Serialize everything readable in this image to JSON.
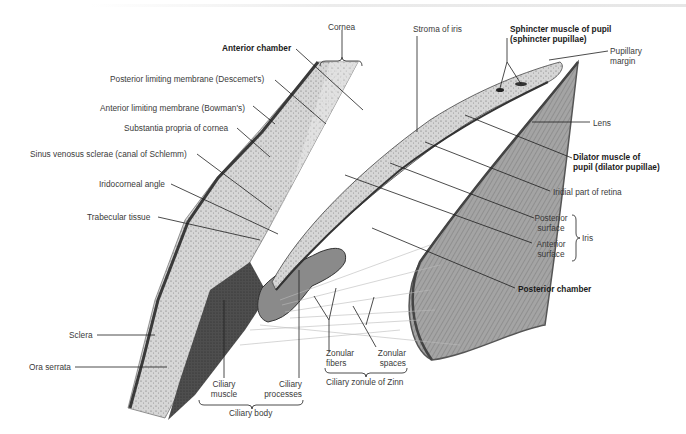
{
  "figure": {
    "type": "anatomical illustration"
  },
  "labels": {
    "cornea": "Cornea",
    "anterior_chamber": "Anterior chamber",
    "descemet": "Posterior limiting membrane (Descemet's)",
    "bowman": "Anterior limiting membrane (Bowman's)",
    "substantia": "Substantia propria of cornea",
    "schlemm": "Sinus venosus sclerae (canal of Schlemm)",
    "iridocorneal": "Iridocorneal angle",
    "trabecular": "Trabecular tissue",
    "sclera": "Sclera",
    "ora_serrata": "Ora serrata",
    "ciliary_muscle_1": "Ciliary",
    "ciliary_muscle_2": "muscle",
    "ciliary_processes_1": "Ciliary",
    "ciliary_processes_2": "processes",
    "ciliary_body": "Ciliary body",
    "zonular_fibers_1": "Zonular",
    "zonular_fibers_2": "fibers",
    "zonular_spaces_1": "Zonular",
    "zonular_spaces_2": "spaces",
    "zonule_zinn": "Ciliary zonule of Zinn",
    "stroma_iris": "Stroma of iris",
    "sphincter_1": "Sphincter muscle of pupil",
    "sphincter_2": "(sphincter pupillae)",
    "pupillary_1": "Pupillary",
    "pupillary_2": "margin",
    "lens": "Lens",
    "dilator_1": "Dilator muscle of",
    "dilator_2": "pupil (dilator pupillae)",
    "iridial_retina": "Iridial part of retina",
    "posterior_surface_1": "Posterior",
    "posterior_surface_2": "surface",
    "anterior_surface_1": "Anterior",
    "anterior_surface_2": "surface",
    "iris": "Iris",
    "posterior_chamber": "Posterior chamber"
  },
  "colors": {
    "line": "#1e1e1e",
    "label_text": "#3a3a3a",
    "bold_text": "#1a1a1a",
    "tissue_light": "#cfcfcf",
    "tissue_mid": "#a8a8a8",
    "tissue_dark": "#4a4a4a",
    "lens": "#9a9a9a"
  }
}
